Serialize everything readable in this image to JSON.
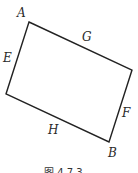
{
  "figure": {
    "caption": "图 4.7.3",
    "shape": "quadrilateral",
    "vertices": [
      {
        "name": "A",
        "x": 29,
        "y": 22
      },
      {
        "name": "",
        "x": 132,
        "y": 70
      },
      {
        "name": "B",
        "x": 109,
        "y": 142
      },
      {
        "name": "",
        "x": 6,
        "y": 94
      }
    ],
    "labels": {
      "A": "A",
      "B": "B",
      "E": "E",
      "F": "F",
      "G": "G",
      "H": "H"
    },
    "stroke_color": "#222222"
  }
}
